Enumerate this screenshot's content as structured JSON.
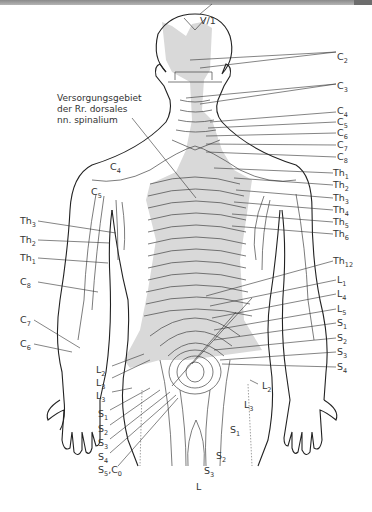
{
  "figure": {
    "caption": [
      "Versorgungsgebiet",
      "der Rr. dorsales",
      "nn. spinalium"
    ],
    "shade_color": "#d9d9d9",
    "line_color": "#222222",
    "top_label": "V/1",
    "right_labels": [
      {
        "base": "C",
        "sub": "2",
        "y": 57
      },
      {
        "base": "C",
        "sub": "3",
        "y": 86
      },
      {
        "base": "C",
        "sub": "4",
        "y": 111
      },
      {
        "base": "C",
        "sub": "5",
        "y": 122
      },
      {
        "base": "C",
        "sub": "6",
        "y": 133
      },
      {
        "base": "C",
        "sub": "7",
        "y": 145
      },
      {
        "base": "C",
        "sub": "8",
        "y": 157
      },
      {
        "base": "Th",
        "sub": "1",
        "y": 173
      },
      {
        "base": "Th",
        "sub": "2",
        "y": 185
      },
      {
        "base": "Th",
        "sub": "3",
        "y": 198
      },
      {
        "base": "Th",
        "sub": "4",
        "y": 210
      },
      {
        "base": "Th",
        "sub": "5",
        "y": 222
      },
      {
        "base": "Th",
        "sub": "6",
        "y": 234
      },
      {
        "base": "Th",
        "sub": "12",
        "y": 261
      },
      {
        "base": "L",
        "sub": "1",
        "y": 280
      },
      {
        "base": "L",
        "sub": "4",
        "y": 294
      },
      {
        "base": "L",
        "sub": "5",
        "y": 309
      },
      {
        "base": "S",
        "sub": "1",
        "y": 323
      },
      {
        "base": "S",
        "sub": "2",
        "y": 338
      },
      {
        "base": "S",
        "sub": "3",
        "y": 352
      },
      {
        "base": "S",
        "sub": "4",
        "y": 367
      }
    ],
    "left_labels": [
      {
        "base": "Th",
        "sub": "3",
        "x": 20,
        "y": 221
      },
      {
        "base": "Th",
        "sub": "2",
        "x": 20,
        "y": 240
      },
      {
        "base": "Th",
        "sub": "1",
        "x": 20,
        "y": 258
      },
      {
        "base": "C",
        "sub": "8",
        "x": 20,
        "y": 282
      },
      {
        "base": "C",
        "sub": "7",
        "x": 20,
        "y": 320
      },
      {
        "base": "C",
        "sub": "6",
        "x": 20,
        "y": 344
      }
    ],
    "body_labels": [
      {
        "base": "C",
        "sub": "4",
        "x": 110,
        "y": 167
      },
      {
        "base": "C",
        "sub": "5",
        "x": 91,
        "y": 192
      },
      {
        "base": "L",
        "sub": "2",
        "x": 96,
        "y": 370
      },
      {
        "base": "L",
        "sub": "3",
        "x": 96,
        "y": 383
      },
      {
        "base": "L",
        "sub": "3",
        "x": 96,
        "y": 396
      },
      {
        "base": "S",
        "sub": "1",
        "x": 98,
        "y": 414
      },
      {
        "base": "S",
        "sub": "2",
        "x": 98,
        "y": 429
      },
      {
        "base": "S",
        "sub": "3",
        "x": 98,
        "y": 443
      },
      {
        "base": "S",
        "sub": "4",
        "x": 98,
        "y": 457
      },
      {
        "base": "S",
        "sub": "5",
        "x": 98,
        "y": 470,
        "extra": ",C",
        "extra_sub": "0"
      },
      {
        "base": "L",
        "sub": "2",
        "x": 262,
        "y": 386
      },
      {
        "base": "L",
        "sub": "3",
        "x": 244,
        "y": 405
      },
      {
        "base": "S",
        "sub": "1",
        "x": 230,
        "y": 430
      },
      {
        "base": "S",
        "sub": "2",
        "x": 216,
        "y": 456
      },
      {
        "base": "S",
        "sub": "3",
        "x": 204,
        "y": 471
      },
      {
        "base": "L",
        "sub": "",
        "x": 196,
        "y": 487
      }
    ]
  }
}
